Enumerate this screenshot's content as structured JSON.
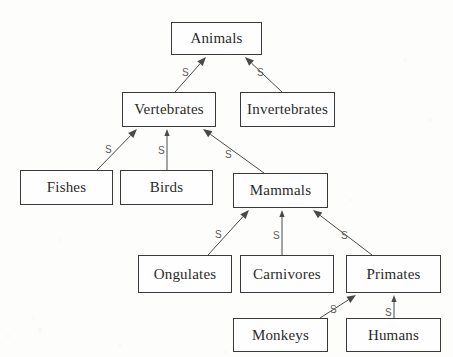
{
  "diagram": {
    "background_color": "#fdfdfc",
    "box_border_color": "#3a3a3a",
    "box_fill_color": "#fefefe",
    "text_color": "#2b2b2b",
    "edge_color": "#4a4a4a",
    "edge_label_color": "#5c5c5c",
    "faint_top_mark": "",
    "nodes": [
      {
        "id": "animals",
        "label": "Animals",
        "x": 171,
        "y": 22,
        "w": 91,
        "h": 33
      },
      {
        "id": "vertebrates",
        "label": "Vertebrates",
        "x": 122,
        "y": 92,
        "w": 94,
        "h": 35
      },
      {
        "id": "invertebrates",
        "label": "Invertebrates",
        "x": 240,
        "y": 92,
        "w": 95,
        "h": 35
      },
      {
        "id": "fishes",
        "label": "Fishes",
        "x": 20,
        "y": 170,
        "w": 93,
        "h": 35
      },
      {
        "id": "birds",
        "label": "Birds",
        "x": 120,
        "y": 170,
        "w": 93,
        "h": 35
      },
      {
        "id": "mammals",
        "label": "Mammals",
        "x": 233,
        "y": 173,
        "w": 95,
        "h": 35
      },
      {
        "id": "ongulates",
        "label": "Ongulates",
        "x": 138,
        "y": 255,
        "w": 94,
        "h": 38
      },
      {
        "id": "carnivores",
        "label": "Carnivores",
        "x": 240,
        "y": 255,
        "w": 94,
        "h": 38
      },
      {
        "id": "primates",
        "label": "Primates",
        "x": 346,
        "y": 255,
        "w": 95,
        "h": 38
      },
      {
        "id": "monkeys",
        "label": "Monkeys",
        "x": 233,
        "y": 318,
        "w": 95,
        "h": 34
      },
      {
        "id": "humans",
        "label": "Humans",
        "x": 346,
        "y": 318,
        "w": 95,
        "h": 34
      }
    ],
    "edges": [
      {
        "id": "vertebrates-animals",
        "from": "vertebrates",
        "to": "animals",
        "label": "S",
        "x1": 175,
        "y1": 92,
        "x2": 206,
        "y2": 57,
        "lx": 182,
        "ly": 68,
        "arrow": "filled"
      },
      {
        "id": "invertebrates-animals",
        "from": "invertebrates",
        "to": "animals",
        "label": "S",
        "x1": 282,
        "y1": 92,
        "x2": 245,
        "y2": 57,
        "lx": 257,
        "ly": 68,
        "arrow": "filled"
      },
      {
        "id": "fishes-vertebrates",
        "from": "fishes",
        "to": "vertebrates",
        "label": "S",
        "x1": 97,
        "y1": 170,
        "x2": 137,
        "y2": 129,
        "lx": 105,
        "ly": 145,
        "arrow": "filled"
      },
      {
        "id": "birds-vertebrates",
        "from": "birds",
        "to": "vertebrates",
        "label": "S",
        "x1": 167,
        "y1": 170,
        "x2": 167,
        "y2": 129,
        "lx": 158,
        "ly": 146,
        "arrow": "line"
      },
      {
        "id": "mammals-vertebrates",
        "from": "mammals",
        "to": "vertebrates",
        "label": "S",
        "x1": 264,
        "y1": 173,
        "x2": 203,
        "y2": 129,
        "lx": 225,
        "ly": 150,
        "arrow": "filled"
      },
      {
        "id": "ongulates-mammals",
        "from": "ongulates",
        "to": "mammals",
        "label": "S",
        "x1": 208,
        "y1": 255,
        "x2": 249,
        "y2": 210,
        "lx": 215,
        "ly": 230,
        "arrow": "filled"
      },
      {
        "id": "carnivores-mammals",
        "from": "carnivores",
        "to": "mammals",
        "label": "S",
        "x1": 282,
        "y1": 255,
        "x2": 282,
        "y2": 210,
        "lx": 273,
        "ly": 231,
        "arrow": "line"
      },
      {
        "id": "primates-mammals",
        "from": "primates",
        "to": "mammals",
        "label": "S",
        "x1": 372,
        "y1": 255,
        "x2": 313,
        "y2": 210,
        "lx": 341,
        "ly": 231,
        "arrow": "filled"
      },
      {
        "id": "monkeys-primates",
        "from": "monkeys",
        "to": "primates",
        "label": "S",
        "x1": 320,
        "y1": 318,
        "x2": 356,
        "y2": 295,
        "lx": 330,
        "ly": 305,
        "arrow": "filled"
      },
      {
        "id": "humans-primates",
        "from": "humans",
        "to": "primates",
        "label": "S",
        "x1": 394,
        "y1": 318,
        "x2": 394,
        "y2": 295,
        "lx": 385,
        "ly": 308,
        "arrow": "line"
      }
    ]
  }
}
